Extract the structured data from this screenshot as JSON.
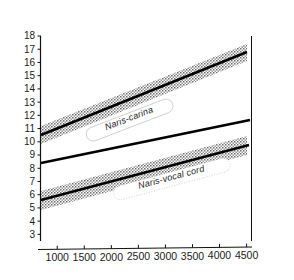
{
  "chart_data": {
    "type": "line",
    "title": "",
    "ylabel": "Distance (cm)",
    "xlabel": "Weight (gm)",
    "xlim": [
      700,
      4600
    ],
    "ylim": [
      2.5,
      18
    ],
    "grid": false,
    "legend": "inline-labels-on-bands",
    "xticks": [
      1000,
      1500,
      2000,
      2500,
      3000,
      3500,
      4000,
      4500
    ],
    "xtick_labels": [
      "1000",
      "1500",
      "2000",
      "2500",
      "3000",
      "3500",
      "4000",
      "4500"
    ],
    "yticks": [
      3,
      4,
      5,
      6,
      7,
      8,
      9,
      10,
      11,
      12,
      13,
      14,
      15,
      16,
      17,
      18
    ],
    "ytick_labels": [
      "3",
      "4",
      "5",
      "6",
      "7",
      "8",
      "9",
      "10",
      "11",
      "12",
      "13",
      "14",
      "15",
      "16",
      "17",
      "18"
    ],
    "series": [
      {
        "name": "Naris-carina",
        "label": "Naris-carina",
        "style": "solid-black-with-stippled-band",
        "x": [
          750,
          4200
        ],
        "y": [
          9.3,
          16.0
        ],
        "band_upper": [
          10.4,
          17.3
        ],
        "band_lower": [
          8.1,
          14.8
        ]
      },
      {
        "name": "middle-regression-line",
        "label": "",
        "style": "solid-black-no-band",
        "x": [
          750,
          4250
        ],
        "y": [
          7.0,
          13.0
        ]
      },
      {
        "name": "Naris-vocal cord",
        "label": "Naris-vocal cord",
        "style": "solid-black-with-stippled-band",
        "x": [
          750,
          4250
        ],
        "y": [
          5.5,
          10.4
        ],
        "band_upper": [
          6.4,
          11.3
        ],
        "band_lower": [
          4.4,
          9.4
        ]
      }
    ]
  },
  "labels": {
    "y_axis_title": "Distance (cm)",
    "x_axis_title": "Weight (gm)",
    "band_top": "Naris-carina",
    "band_bottom": "Naris-vocal cord"
  },
  "colors": {
    "line": "#000000",
    "band": "#7a7a7a",
    "axis": "#111111",
    "background": "#ffffff"
  }
}
